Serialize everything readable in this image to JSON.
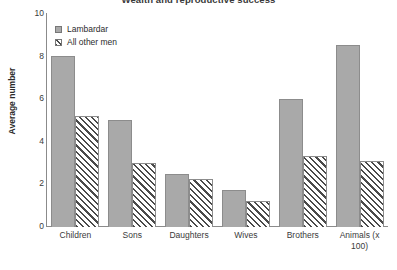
{
  "chart_data": {
    "type": "bar",
    "title": "Wealth and reproductive success",
    "xlabel": "",
    "ylabel": "Average number",
    "ylim": [
      0,
      10
    ],
    "yticks": [
      10,
      8,
      6,
      4,
      2,
      0
    ],
    "grid": false,
    "legend_position": "top-left",
    "categories": [
      "Children",
      "Sons",
      "Daughters",
      "Wives",
      "Brothers",
      "Animals (x 100)"
    ],
    "series": [
      {
        "name": "Lambardar",
        "style": "solid-gray",
        "values": [
          8.0,
          5.0,
          2.5,
          1.75,
          6.0,
          8.5
        ]
      },
      {
        "name": "All other men",
        "style": "diagonal-hatch",
        "values": [
          5.2,
          3.0,
          2.25,
          1.2,
          3.3,
          3.1
        ]
      }
    ]
  },
  "colors": {
    "series_solid": "#a9a9a9",
    "series_hatch_line": "#4a4a4a",
    "axis": "#8b8b8b",
    "text": "#2b2b2b",
    "background": "#ffffff"
  }
}
